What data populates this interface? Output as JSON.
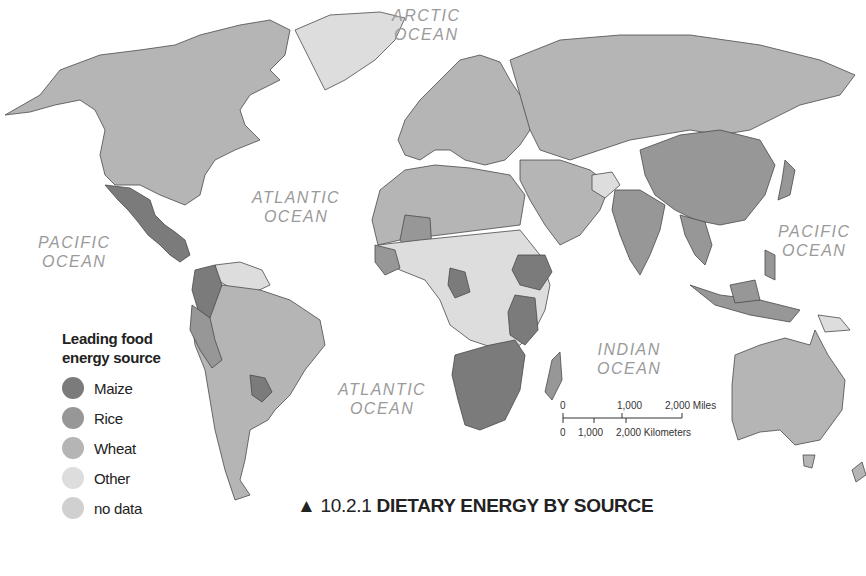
{
  "figure": {
    "number": "10.2.1",
    "marker": "▲",
    "title": "DIETARY ENERGY BY SOURCE"
  },
  "oceans": {
    "arctic": {
      "line1": "ARCTIC",
      "line2": "OCEAN"
    },
    "atlantic_north": {
      "line1": "ATLANTIC",
      "line2": "OCEAN"
    },
    "atlantic_south": {
      "line1": "ATLANTIC",
      "line2": "OCEAN"
    },
    "pacific_west": {
      "line1": "PACIFIC",
      "line2": "OCEAN"
    },
    "pacific_east": {
      "line1": "PACIFIC",
      "line2": "OCEAN"
    },
    "indian": {
      "line1": "INDIAN",
      "line2": "OCEAN"
    }
  },
  "legend": {
    "title_line1": "Leading food",
    "title_line2": "energy source",
    "items": [
      {
        "label": "Maize",
        "color": "#7b7b7b"
      },
      {
        "label": "Rice",
        "color": "#979797"
      },
      {
        "label": "Wheat",
        "color": "#b5b5b5"
      },
      {
        "label": "Other",
        "color": "#dddddd"
      },
      {
        "label": "no data",
        "color": "#d0d0d0"
      }
    ]
  },
  "scale_bar": {
    "miles_ticks": [
      "0",
      "1,000",
      "2,000 Miles"
    ],
    "km_ticks": [
      "0",
      "1,000",
      "2,000 Kilometers"
    ]
  },
  "colors": {
    "maize": "#7b7b7b",
    "rice": "#979797",
    "wheat": "#b5b5b5",
    "other": "#dddddd",
    "no_data": "#d0d0d0",
    "border": "#3a3a3a"
  }
}
